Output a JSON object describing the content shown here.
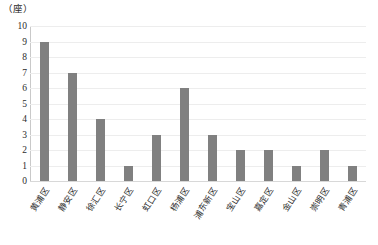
{
  "chart_data": {
    "type": "bar",
    "title": "",
    "subtitle": "",
    "xlabel": "",
    "ylabel": "",
    "y_unit_label": "（座）",
    "ylim": [
      0,
      10
    ],
    "ytick_step": 1,
    "ytick_labels": [
      "10",
      "9",
      "8",
      "7",
      "6",
      "5",
      "4",
      "3",
      "2",
      "1",
      "0"
    ],
    "grid": true,
    "grid_axis": "y",
    "legend": false,
    "legend_position": "none",
    "bar_color": "#808080",
    "categories": [
      "黄浦区",
      "静安区",
      "徐汇区",
      "长宁区",
      "虹口区",
      "杨浦区",
      "浦东新区",
      "宝山区",
      "嘉定区",
      "金山区",
      "崇明区",
      "青浦区"
    ],
    "values": [
      9,
      7,
      4,
      1,
      3,
      6,
      3,
      2,
      2,
      1,
      2,
      1
    ],
    "annotations": []
  },
  "caption": {
    "text": ""
  }
}
